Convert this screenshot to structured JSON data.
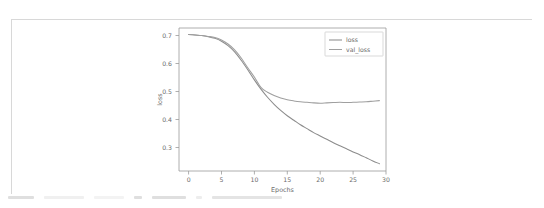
{
  "card": {
    "background": "#ffffff",
    "border_color": "#d8d8d8"
  },
  "chart_data": {
    "type": "line",
    "title": "",
    "xlabel": "Epochs",
    "ylabel": "loss",
    "xlim": [
      -1.45,
      30.0
    ],
    "ylim": [
      0.205,
      0.715
    ],
    "xticks": [
      0,
      5,
      10,
      15,
      20,
      25,
      30
    ],
    "xticklabels": [
      "0",
      "5",
      "10",
      "15",
      "20",
      "25",
      "30"
    ],
    "yticks": [
      0.3,
      0.4,
      0.5,
      0.6,
      0.7
    ],
    "yticklabels": [
      "0.3",
      "0.4",
      "0.5",
      "0.6",
      "0.7"
    ],
    "grid": false,
    "legend_position": "upper right",
    "legend_entries": [
      "loss",
      "val_loss"
    ],
    "x": [
      0,
      1,
      2,
      3,
      4,
      5,
      6,
      7,
      8,
      9,
      10,
      11,
      12,
      13,
      14,
      15,
      16,
      17,
      18,
      19,
      20,
      21,
      22,
      23,
      24,
      25,
      26,
      27,
      28,
      29
    ],
    "series": [
      {
        "name": "loss",
        "color": "#8c8c8c",
        "values": [
          0.692,
          0.69,
          0.688,
          0.684,
          0.678,
          0.668,
          0.652,
          0.63,
          0.6,
          0.566,
          0.53,
          0.497,
          0.468,
          0.443,
          0.421,
          0.402,
          0.386,
          0.37,
          0.356,
          0.342,
          0.33,
          0.318,
          0.306,
          0.295,
          0.284,
          0.273,
          0.263,
          0.252,
          0.241,
          0.231
        ]
      },
      {
        "name": "val_loss",
        "color": "#9f9f9f",
        "values": [
          0.692,
          0.69,
          0.688,
          0.685,
          0.681,
          0.672,
          0.658,
          0.637,
          0.608,
          0.573,
          0.54,
          0.503,
          0.486,
          0.474,
          0.465,
          0.459,
          0.455,
          0.452,
          0.45,
          0.448,
          0.447,
          0.448,
          0.449,
          0.45,
          0.449,
          0.45,
          0.451,
          0.452,
          0.454,
          0.456
        ]
      }
    ]
  },
  "axis_style": {
    "spine_color": "#9a9a9a",
    "tick_text_color": "#6b6b6b"
  },
  "bottom_strip": {
    "clipped_label": ""
  }
}
